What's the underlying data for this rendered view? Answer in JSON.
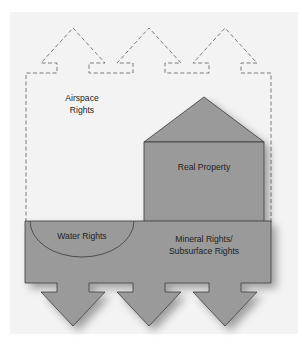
{
  "diagram": {
    "type": "property-rights-illustration",
    "labels": {
      "airspace_line1": "Airspace",
      "airspace_line2": "Rights",
      "real_property": "Real Property",
      "water_rights": "Water Rights",
      "mineral_line1": "Mineral Rights/",
      "mineral_line2": "Subsurface Rights"
    },
    "colors": {
      "panel_background": "#f2f2f2",
      "fill_gray": "#9a9a9a",
      "outline": "#3a3a3a",
      "dashed_outline": "#5a5a5a"
    },
    "upward_arrows_count": 3,
    "downward_arrows_count": 3
  }
}
